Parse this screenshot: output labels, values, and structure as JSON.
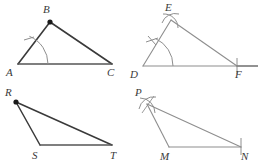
{
  "figure": {
    "type": "geometry-construction-figure",
    "panel_count": 4,
    "stroke_colors": {
      "dark_segment": "#3a3a3a",
      "light_segment": "#8e8e8e",
      "mark": "#8e8e8e",
      "vertex_dot": "#1a1a1a",
      "label": "#3a3a3a"
    }
  },
  "panels": [
    {
      "id": "abc",
      "name": "triangle-abc",
      "vertices": [
        {
          "label": "A",
          "x": 18,
          "y": 64,
          "label_x": 6,
          "label_y": 76,
          "dot": false
        },
        {
          "label": "B",
          "x": 50,
          "y": 22,
          "label_x": 43,
          "label_y": 13,
          "dot": true
        },
        {
          "label": "C",
          "x": 112,
          "y": 64,
          "label_x": 107,
          "label_y": 76,
          "dot": false
        }
      ],
      "segments": [
        {
          "name": "segment-ab",
          "from": "A",
          "to": "B",
          "weight": "dark"
        },
        {
          "name": "segment-bc",
          "from": "B",
          "to": "C",
          "weight": "dark"
        },
        {
          "name": "segment-ac",
          "from": "A",
          "to": "C",
          "weight": "dark"
        }
      ],
      "angle_arc": {
        "name": "angle-arc-a",
        "vertex": "A",
        "radius": 30
      },
      "tick_marks": [
        {
          "name": "tick-on-ab",
          "on": "segment-ab"
        }
      ]
    },
    {
      "id": "def",
      "name": "triangle-def",
      "vertices": [
        {
          "label": "D",
          "x": 14,
          "y": 66,
          "label_x": 1,
          "label_y": 78,
          "dot": false
        },
        {
          "label": "E",
          "x": 42,
          "y": 20,
          "label_x": 36,
          "label_y": 11,
          "dot": false
        },
        {
          "label": "F",
          "x": 108,
          "y": 66,
          "label_x": 106,
          "label_y": 78,
          "dot": false
        }
      ],
      "segments": [
        {
          "name": "segment-de",
          "from": "D",
          "to": "E",
          "weight": "light"
        },
        {
          "name": "segment-ef",
          "from": "E",
          "to": "F",
          "weight": "light"
        },
        {
          "name": "segment-df",
          "from": "D",
          "to": "F",
          "weight": "light"
        }
      ],
      "ray_extension": {
        "name": "ray-beyond-f",
        "from": "F",
        "to_x": 129
      },
      "angle_arc": {
        "name": "angle-arc-d",
        "vertex": "D",
        "radius": 30
      },
      "construction_arcs": [
        {
          "name": "construction-arc-at-e",
          "at": "E"
        }
      ],
      "tick_marks": [
        {
          "name": "tick-on-de",
          "on": "segment-de"
        },
        {
          "name": "tick-at-f",
          "on": "segment-df"
        }
      ]
    },
    {
      "id": "rst",
      "name": "triangle-rst",
      "vertices": [
        {
          "label": "R",
          "x": 16,
          "y": 19,
          "label_x": 5,
          "label_y": 13,
          "dot": true
        },
        {
          "label": "S",
          "x": 40,
          "y": 62,
          "label_x": 32,
          "label_y": 76,
          "dot": false
        },
        {
          "label": "T",
          "x": 112,
          "y": 62,
          "label_x": 110,
          "label_y": 76,
          "dot": false
        }
      ],
      "segments": [
        {
          "name": "segment-rs",
          "from": "R",
          "to": "S",
          "weight": "dark"
        },
        {
          "name": "segment-rt",
          "from": "R",
          "to": "T",
          "weight": "dark"
        },
        {
          "name": "segment-st",
          "from": "S",
          "to": "T",
          "weight": "dark"
        }
      ],
      "angle_arc": null,
      "tick_marks": []
    },
    {
      "id": "pmn",
      "name": "triangle-pmn",
      "vertices": [
        {
          "label": "P",
          "x": 18,
          "y": 21,
          "label_x": 6,
          "label_y": 13,
          "dot": false
        },
        {
          "label": "M",
          "x": 40,
          "y": 64,
          "label_x": 31,
          "label_y": 77,
          "dot": false
        },
        {
          "label": "N",
          "x": 112,
          "y": 64,
          "label_x": 112,
          "label_y": 77,
          "dot": false
        }
      ],
      "segments": [
        {
          "name": "segment-pm",
          "from": "P",
          "to": "M",
          "weight": "light"
        },
        {
          "name": "segment-pn",
          "from": "P",
          "to": "N",
          "weight": "light"
        },
        {
          "name": "segment-mn",
          "from": "M",
          "to": "N",
          "weight": "light"
        }
      ],
      "construction_arcs": [
        {
          "name": "construction-arc-at-p",
          "at": "P"
        }
      ],
      "tick_marks": [
        {
          "name": "tick-at-n",
          "on": "segment-mn"
        }
      ]
    }
  ]
}
